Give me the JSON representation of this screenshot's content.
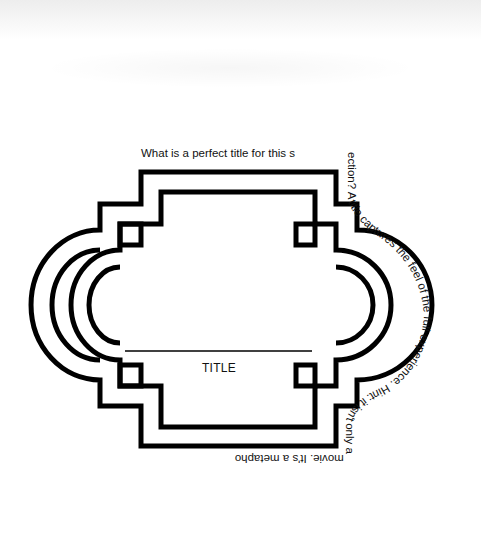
{
  "diagram": {
    "type": "ornamental title frame",
    "stroke_color": "#000000",
    "background": "#ffffff",
    "title_label": "TITLE",
    "prompt_straight": "What is a perfect title for this s",
    "prompt_path": "ection? A title captures the feel of the full experience. Hint: it isn't only a movie. It's a metaphor."
  }
}
